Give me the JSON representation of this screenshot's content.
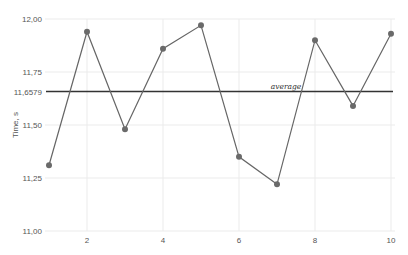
{
  "chart_data": {
    "type": "line",
    "title": "",
    "xlabel": "",
    "ylabel": "Time, s",
    "x": [
      1,
      2,
      3,
      4,
      5,
      6,
      7,
      8,
      9,
      10
    ],
    "series": [
      {
        "name": "Time",
        "values": [
          11.31,
          11.94,
          11.48,
          11.86,
          11.97,
          11.35,
          11.22,
          11.9,
          11.59,
          11.93
        ],
        "color": "#666666"
      }
    ],
    "reference_lines": [
      {
        "label": "average",
        "value": 11.6579,
        "value_label": "11,6579",
        "color": "#333333"
      }
    ],
    "xlim": [
      1,
      10
    ],
    "ylim": [
      11.0,
      12.0
    ],
    "x_ticks": [
      "2",
      "4",
      "6",
      "8",
      "10"
    ],
    "y_ticks": [
      "11,00",
      "11,25",
      "11,50",
      "11,75",
      "12,00"
    ],
    "grid": true,
    "legend": "none"
  }
}
